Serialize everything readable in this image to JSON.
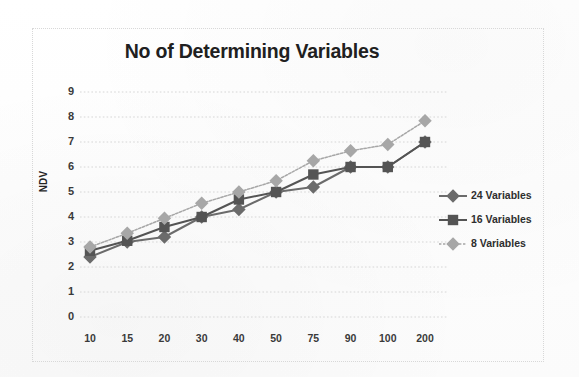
{
  "chart_data": {
    "type": "line",
    "title": "No of Determining Variables",
    "xlabel": "",
    "ylabel": "NDV",
    "categories": [
      "10",
      "15",
      "20",
      "30",
      "40",
      "50",
      "75",
      "90",
      "100",
      "200"
    ],
    "ylim": [
      0,
      9
    ],
    "yticks": [
      "0",
      "1",
      "2",
      "3",
      "4",
      "5",
      "6",
      "7",
      "8",
      "9"
    ],
    "grid": "horizontal-dotted",
    "legend_position": "right",
    "series": [
      {
        "name": "24 Variables",
        "marker": "diamond",
        "color": "#6b6b6b",
        "values": [
          2.4,
          3.0,
          3.2,
          4.0,
          4.3,
          5.0,
          5.2,
          6.0,
          6.0,
          7.0
        ]
      },
      {
        "name": "16 Variables",
        "marker": "square",
        "color": "#545454",
        "values": [
          2.65,
          3.05,
          3.6,
          4.0,
          4.7,
          5.0,
          5.7,
          6.0,
          6.0,
          7.0
        ]
      },
      {
        "name": "8 Variables",
        "marker": "diamond",
        "color": "#a7a7a7",
        "values": [
          2.8,
          3.35,
          3.95,
          4.55,
          5.0,
          5.45,
          6.25,
          6.65,
          6.9,
          7.85
        ]
      }
    ]
  },
  "chart": {
    "title": "No of Determining Variables",
    "y_axis_title": "NDV"
  },
  "legend": {
    "items": [
      {
        "label": "24 Variables"
      },
      {
        "label": "16 Variables"
      },
      {
        "label": "8 Variables"
      }
    ]
  }
}
